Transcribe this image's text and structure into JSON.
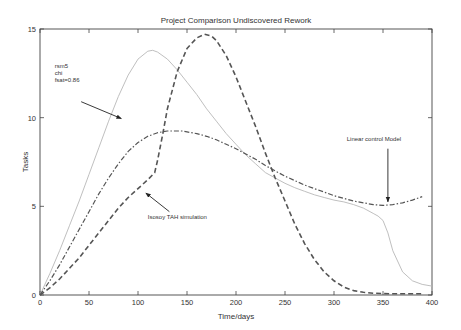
{
  "chart_data": {
    "type": "line",
    "title": "Project Comparison Undiscovered Rework",
    "xlabel": "Time/days",
    "ylabel": "Tasks",
    "xlim": [
      0,
      400
    ],
    "ylim": [
      0,
      15
    ],
    "xticks": [
      0,
      50,
      100,
      150,
      200,
      250,
      300,
      350,
      400
    ],
    "yticks": [
      0,
      5,
      10,
      15
    ],
    "grid": false,
    "legend": "none (inline annotations)",
    "series": [
      {
        "name": "rsm5 chi fsat=0.86",
        "style": "solid",
        "color": "#b8b8b8",
        "x": [
          0,
          10,
          20,
          30,
          40,
          50,
          60,
          70,
          80,
          90,
          100,
          110,
          115,
          120,
          130,
          140,
          150,
          160,
          170,
          180,
          190,
          200,
          210,
          220,
          230,
          240,
          250,
          260,
          270,
          280,
          290,
          300,
          310,
          320,
          330,
          340,
          345,
          350,
          355,
          360,
          370,
          380,
          390,
          400
        ],
        "y": [
          0,
          1.2,
          2.5,
          3.9,
          5.3,
          6.8,
          8.3,
          9.8,
          11.2,
          12.4,
          13.3,
          13.75,
          13.8,
          13.7,
          13.3,
          12.7,
          12.0,
          11.3,
          10.5,
          9.8,
          9.1,
          8.5,
          7.9,
          7.4,
          6.9,
          6.6,
          6.3,
          6.05,
          5.85,
          5.65,
          5.5,
          5.35,
          5.25,
          5.1,
          4.9,
          4.6,
          4.45,
          4.2,
          3.5,
          2.5,
          1.3,
          0.8,
          0.6,
          0.5
        ]
      },
      {
        "name": "Linear control Model",
        "style": "dashdot",
        "color": "#555555",
        "x": [
          0,
          10,
          20,
          30,
          40,
          50,
          60,
          70,
          80,
          90,
          100,
          110,
          120,
          130,
          140,
          145,
          150,
          160,
          170,
          180,
          190,
          200,
          210,
          220,
          230,
          240,
          250,
          260,
          270,
          280,
          290,
          300,
          310,
          320,
          330,
          340,
          350,
          360,
          370,
          380,
          390
        ],
        "y": [
          0,
          0.8,
          1.7,
          2.7,
          3.7,
          4.7,
          5.7,
          6.6,
          7.4,
          8.1,
          8.6,
          8.95,
          9.15,
          9.25,
          9.25,
          9.25,
          9.2,
          9.1,
          8.95,
          8.75,
          8.5,
          8.25,
          7.95,
          7.65,
          7.3,
          7.0,
          6.7,
          6.45,
          6.2,
          6.0,
          5.8,
          5.6,
          5.45,
          5.3,
          5.2,
          5.1,
          5.05,
          5.1,
          5.2,
          5.35,
          5.55
        ]
      },
      {
        "name": "Isosoy TAH simulation",
        "style": "dashed",
        "color": "#555555",
        "x": [
          0,
          10,
          20,
          30,
          40,
          50,
          60,
          70,
          80,
          90,
          100,
          110,
          117,
          120,
          125,
          130,
          140,
          150,
          160,
          168,
          175,
          180,
          190,
          200,
          210,
          220,
          230,
          240,
          250,
          260,
          270,
          280,
          290,
          300,
          310,
          320,
          330,
          340,
          350,
          360,
          370,
          380,
          390
        ],
        "y": [
          0,
          0.4,
          0.9,
          1.5,
          2.1,
          2.8,
          3.5,
          4.2,
          4.9,
          5.5,
          6.0,
          6.5,
          6.9,
          7.6,
          9.0,
          10.5,
          12.6,
          13.9,
          14.5,
          14.7,
          14.6,
          14.35,
          13.5,
          12.3,
          10.9,
          9.5,
          8.0,
          6.6,
          5.3,
          4.0,
          2.9,
          2.0,
          1.3,
          0.8,
          0.45,
          0.25,
          0.15,
          0.1,
          0.08,
          0.07,
          0.07,
          0.07,
          0.07
        ]
      }
    ],
    "annotations": [
      {
        "lines": [
          "rsm5",
          "chi",
          "fsat=0.86"
        ],
        "text_x": 15,
        "text_y": 12.8,
        "arrow_from": [
          42,
          10.9
        ],
        "arrow_to": [
          83,
          9.95
        ]
      },
      {
        "lines": [
          "Isosoy TAH simulation"
        ],
        "text_x": 110,
        "text_y": 4.3,
        "arrow_from": [
          132,
          4.7
        ],
        "arrow_to": [
          108,
          5.75
        ]
      },
      {
        "lines": [
          "Linear control Model"
        ],
        "text_x": 313,
        "text_y": 8.7,
        "arrow_from": [
          355,
          8.25
        ],
        "arrow_to": [
          355,
          5.25
        ]
      }
    ]
  },
  "layout": {
    "plot_left": 40,
    "plot_right": 432,
    "plot_top": 29,
    "plot_bottom": 295
  }
}
